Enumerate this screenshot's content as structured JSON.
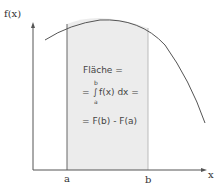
{
  "diagram": {
    "y_axis_label": "f(x)",
    "x_axis_label": "x",
    "lower_bound_label": "a",
    "upper_bound_label": "b",
    "formula": {
      "line1": "Fläche =",
      "line2_prefix": "= ",
      "integral_symbol": "∫",
      "integral_upper": "b",
      "integral_lower": "a",
      "line2_body": "f(x) dx =",
      "line3": "= F(b) - F(a)"
    },
    "colors": {
      "shaded_area": "#ececec",
      "curve": "#555555",
      "axes": "#555555"
    }
  }
}
